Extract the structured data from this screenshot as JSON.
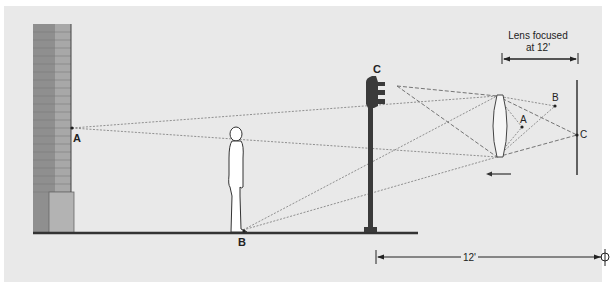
{
  "diagram": {
    "title": "Lens focused at 12'",
    "focus_label_line1": "Lens focused",
    "focus_label_line2": "at 12'",
    "distance_label": "12'",
    "points": {
      "wall_point": "A",
      "ground_point": "B",
      "traffic_light_point": "C",
      "image_A": "A",
      "image_B": "B",
      "image_C": "C"
    },
    "objects": [
      "brick wall",
      "person",
      "traffic light",
      "lens",
      "film plane"
    ],
    "colors": {
      "background": "#e9e9e9",
      "wall": "#8c8c8c",
      "ground": "#333333",
      "traffic_light": "#3a3a3a",
      "ray_lines": "#777777"
    }
  }
}
